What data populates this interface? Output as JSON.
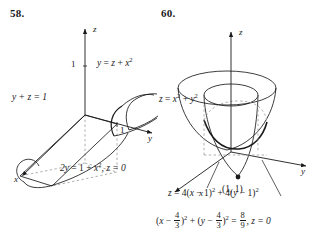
{
  "figures": [
    {
      "number": "58.",
      "axes": {
        "z": "z",
        "y": "y",
        "x": "x"
      },
      "ticks": {
        "z_one": "1",
        "y_one": "1"
      },
      "labels": {
        "surface_top": {
          "lhs": "y",
          "eq": "=",
          "rhs_a": "z",
          "plus": "+",
          "rhs_b": "x",
          "exp": "2"
        },
        "plane": {
          "text": "y + z = 1"
        },
        "trace": {
          "lead": "2y",
          "eq": "=",
          "one": "1",
          "plus": "+",
          "var": "x",
          "exp": "2",
          "tail": ", z = 0"
        }
      }
    },
    {
      "number": "60.",
      "axes": {
        "z": "z",
        "y": "y",
        "x": "x"
      },
      "point": {
        "label": "(1, 1)"
      },
      "labels": {
        "paraboloid": {
          "lhs": "z",
          "eq": "=",
          "a": "x",
          "a_exp": "2",
          "plus": "+",
          "b": "y",
          "b_exp": "2"
        },
        "surface": {
          "lhs": "z",
          "eq": "=",
          "c1": "4",
          "open1": "(",
          "v1": "x",
          "minus1": "−",
          "one1": "1",
          "close1": ")",
          "exp1": "2",
          "plus": "+",
          "c2": "4",
          "open2": "(",
          "v2": "y",
          "minus2": "−",
          "one2": "1",
          "close2": ")",
          "exp2": "2"
        },
        "circle": {
          "open1": "(",
          "v1": "x",
          "minus1": "−",
          "f1n": "4",
          "f1d": "3",
          "close1": ")",
          "exp1": "2",
          "plus": "+",
          "open2": "(",
          "v2": "y",
          "minus2": "−",
          "f2n": "4",
          "f2d": "3",
          "close2": ")",
          "exp2": "2",
          "eq": "=",
          "f3n": "8",
          "f3d": "9",
          "tail": ", z = 0"
        }
      }
    }
  ],
  "colors": {
    "ink": "#1a1a1a",
    "hidden": "#9a9a9a"
  }
}
